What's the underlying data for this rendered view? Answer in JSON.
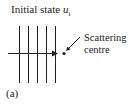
{
  "figure": {
    "title": {
      "text": "Initial state ",
      "symbol": "u",
      "subscript": "i"
    },
    "label_line1": "Scattering",
    "label_line2": "centre",
    "caption": "(a)",
    "wavefront_count": 5,
    "colors": {
      "line": "#222222",
      "background": "#ffffff"
    }
  }
}
